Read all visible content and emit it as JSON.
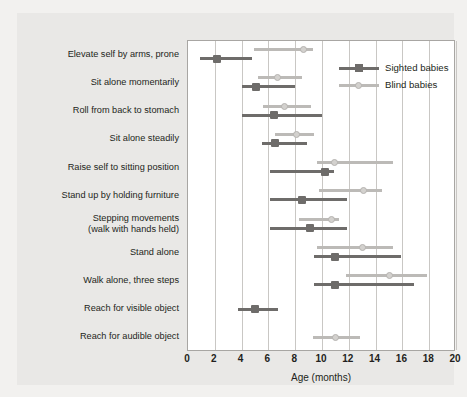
{
  "chart_data": {
    "type": "scatter",
    "title": "",
    "xlabel": "Age (months)",
    "ylabel": "",
    "xlim": [
      0,
      20
    ],
    "xticks": [
      0,
      2,
      4,
      6,
      8,
      10,
      12,
      14,
      16,
      18,
      20
    ],
    "grid": "vertical",
    "legend_position": "top-right",
    "legend": [
      "Sighted babies",
      "Blind babies"
    ],
    "colors": {
      "sighted": "#6e6c6a",
      "blind": "#bcbab7",
      "background": "#e9e8e6",
      "plot_background": "#ffffff",
      "gridline": "#c9c7c4",
      "text": "#231f20"
    },
    "categories": [
      "Elevate self by arms, prone",
      "Sit alone momentarily",
      "Roll from back to stomach",
      "Sit alone steadily",
      "Raise self to sitting position",
      "Stand up by holding furniture",
      "Stepping movements\n(walk with hands held)",
      "Stand alone",
      "Walk alone, three steps",
      "Reach for visible object",
      "Reach for audible object"
    ],
    "series": [
      {
        "name": "Sighted babies",
        "points": [
          {
            "category": "Elevate self by arms, prone",
            "median": 2.2,
            "low": 0.9,
            "high": 4.8
          },
          {
            "category": "Sit alone momentarily",
            "median": 5.1,
            "low": 4.0,
            "high": 8.0
          },
          {
            "category": "Roll from back to stomach",
            "median": 6.4,
            "low": 4.0,
            "high": 10.0
          },
          {
            "category": "Sit alone steadily",
            "median": 6.5,
            "low": 5.5,
            "high": 8.9
          },
          {
            "category": "Raise self to sitting position",
            "median": 10.2,
            "low": 6.1,
            "high": 10.9
          },
          {
            "category": "Stand up by holding furniture",
            "median": 8.5,
            "low": 6.1,
            "high": 11.9
          },
          {
            "category": "Stepping movements\n(walk with hands held)",
            "median": 9.1,
            "low": 6.1,
            "high": 11.9
          },
          {
            "category": "Stand alone",
            "median": 11.0,
            "low": 9.4,
            "high": 15.9
          },
          {
            "category": "Walk alone, three steps",
            "median": 11.0,
            "low": 9.4,
            "high": 16.9
          },
          {
            "category": "Reach for visible object",
            "median": 5.0,
            "low": 3.7,
            "high": 6.7
          }
        ]
      },
      {
        "name": "Blind babies",
        "points": [
          {
            "category": "Elevate self by arms, prone",
            "median": 8.6,
            "low": 4.9,
            "high": 9.3
          },
          {
            "category": "Sit alone momentarily",
            "median": 6.7,
            "low": 5.2,
            "high": 8.5
          },
          {
            "category": "Roll from back to stomach",
            "median": 7.2,
            "low": 5.6,
            "high": 9.2
          },
          {
            "category": "Sit alone steadily",
            "median": 8.1,
            "low": 6.5,
            "high": 9.4
          },
          {
            "category": "Raise self to sitting position",
            "median": 10.9,
            "low": 9.6,
            "high": 15.3
          },
          {
            "category": "Stand up by holding furniture",
            "median": 13.1,
            "low": 9.8,
            "high": 14.5
          },
          {
            "category": "Stepping movements\n(walk with hands held)",
            "median": 10.7,
            "low": 8.3,
            "high": 11.3
          },
          {
            "category": "Stand alone",
            "median": 13.0,
            "low": 9.6,
            "high": 15.3
          },
          {
            "category": "Walk alone, three steps",
            "median": 15.0,
            "low": 11.8,
            "high": 17.8
          },
          {
            "category": "Reach for audible object",
            "median": 11.0,
            "low": 9.3,
            "high": 12.8
          }
        ]
      }
    ]
  }
}
